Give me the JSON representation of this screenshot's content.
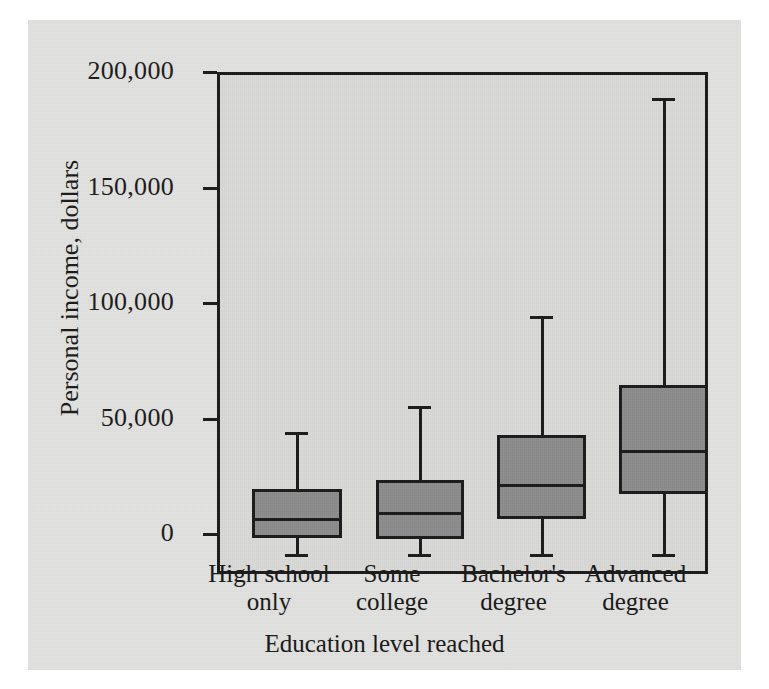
{
  "chart_data": {
    "type": "box",
    "title": "",
    "xlabel": "Education level reached",
    "ylabel": "Personal income, dollars",
    "ylim": [
      0,
      208000
    ],
    "ytick_values": [
      0,
      50000,
      100000,
      150000,
      200000
    ],
    "ytick_labels": [
      "0",
      "50,000",
      "100,000",
      "150,000",
      "200,000"
    ],
    "grid": false,
    "legend": "none",
    "categories": [
      "High school only",
      "Some college",
      "Bachelor's degree",
      "Advanced degree"
    ],
    "category_lines": [
      [
        "High school",
        "only"
      ],
      [
        "Some",
        "college"
      ],
      [
        "Bachelor's",
        "degree"
      ],
      [
        "Advanced",
        "degree"
      ]
    ],
    "boxes": [
      {
        "category": "High school only",
        "min": 0,
        "q1": 7000,
        "median": 15500,
        "q3": 28000,
        "max": 53000
      },
      {
        "category": "Some college",
        "min": 0,
        "q1": 6500,
        "median": 18000,
        "q3": 32000,
        "max": 64000
      },
      {
        "category": "Bachelor's degree",
        "min": 0,
        "q1": 15000,
        "median": 30500,
        "q3": 51500,
        "max": 103000
      },
      {
        "category": "Advanced degree",
        "min": 0,
        "q1": 26000,
        "median": 45000,
        "q3": 73000,
        "max": 197500
      }
    ],
    "colors": {
      "box_fill": "#8c8c8c",
      "line": "#1a1a1a",
      "plot_background": "#d9d9d7",
      "panel_background": "#e2e2e0"
    }
  }
}
